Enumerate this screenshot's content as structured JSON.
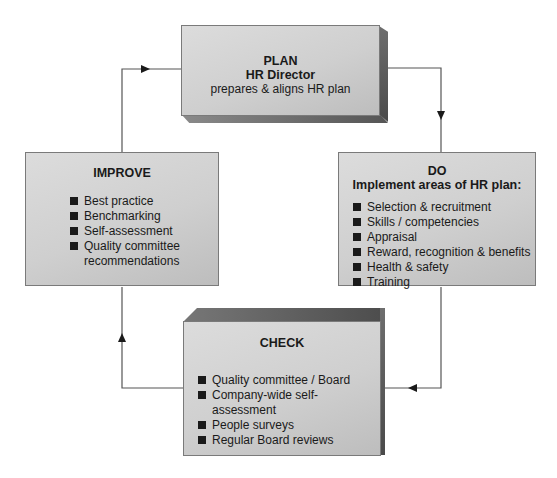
{
  "plan": {
    "title": "PLAN",
    "subtitle": "HR Director",
    "text": "prepares & aligns HR plan"
  },
  "improve": {
    "title": "IMPROVE",
    "items": [
      "Best practice",
      "Benchmarking",
      "Self-assessment",
      "Quality committee recommendations"
    ]
  },
  "do": {
    "title": "DO",
    "subtitle": "Implement areas of HR plan:",
    "items": [
      "Selection & recruitment",
      "Skills / competencies",
      "Appraisal",
      "Reward, recognition & benefits",
      "Health & safety",
      "Training"
    ]
  },
  "check": {
    "title": "CHECK",
    "items": [
      "Quality committee / Board",
      "Company-wide self-assessment",
      "People surveys",
      "Regular Board reviews"
    ]
  },
  "colors": {
    "box_fill": "#cfcfcf",
    "bevel": "#555555",
    "line": "#555555",
    "text": "#1a1a1a"
  }
}
